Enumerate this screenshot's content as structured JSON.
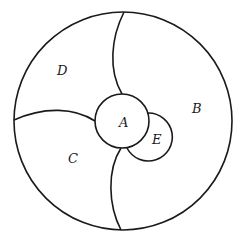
{
  "diagram": {
    "type": "region-map",
    "regions": [
      {
        "id": "A",
        "label": "A",
        "description": "central small circle"
      },
      {
        "id": "B",
        "label": "B",
        "description": "right region"
      },
      {
        "id": "C",
        "label": "C",
        "description": "lower-left region"
      },
      {
        "id": "D",
        "label": "D",
        "description": "upper-left region"
      },
      {
        "id": "E",
        "label": "E",
        "description": "small circle adjacent to A, lower right"
      }
    ],
    "colors": {
      "stroke": "#1a1a1a",
      "background": "#ffffff"
    }
  }
}
